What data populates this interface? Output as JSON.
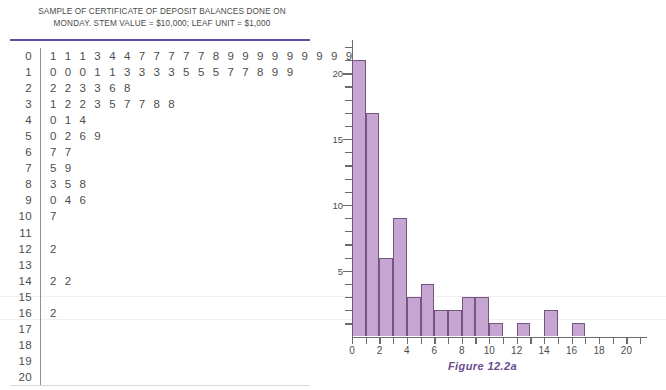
{
  "stem_leaf": {
    "title_line1": "SAMPLE OF CERTIFICATE OF DEPOSIT BALANCES DONE ON",
    "title_line2": "MONDAY. STEM VALUE  =  $10,000; LEAF UNIT  =  $1,000",
    "rows": [
      {
        "stem": "0",
        "leaves": "1 1 1 3 4 4 7 7 7 7 7 8 9 9 9 9 9 9 9 9 9"
      },
      {
        "stem": "1",
        "leaves": "0 0 0 1 1 3 3 3 3 5 5 5 7 7 8 9 9"
      },
      {
        "stem": "2",
        "leaves": "2 2 3 3 6 8"
      },
      {
        "stem": "3",
        "leaves": "1 2 2 3 5 7 7 8 8"
      },
      {
        "stem": "4",
        "leaves": "0 1 4"
      },
      {
        "stem": "5",
        "leaves": "0 2 6 9"
      },
      {
        "stem": "6",
        "leaves": "7 7"
      },
      {
        "stem": "7",
        "leaves": "5 9"
      },
      {
        "stem": "8",
        "leaves": "3 5 8"
      },
      {
        "stem": "9",
        "leaves": "0 4 6"
      },
      {
        "stem": "10",
        "leaves": "7"
      },
      {
        "stem": "11",
        "leaves": ""
      },
      {
        "stem": "12",
        "leaves": "2"
      },
      {
        "stem": "13",
        "leaves": ""
      },
      {
        "stem": "14",
        "leaves": "2 2"
      },
      {
        "stem": "15",
        "leaves": ""
      },
      {
        "stem": "16",
        "leaves": "2"
      },
      {
        "stem": "17",
        "leaves": ""
      },
      {
        "stem": "18",
        "leaves": ""
      },
      {
        "stem": "19",
        "leaves": ""
      },
      {
        "stem": "20",
        "leaves": ""
      }
    ]
  },
  "figure": {
    "caption": "Figure 12.2a",
    "caption_color": "#6b4a8f"
  },
  "chart_data": {
    "type": "bar",
    "title": "",
    "xlabel": "",
    "ylabel": "",
    "xlim": [
      0,
      21.5
    ],
    "ylim": [
      0,
      22
    ],
    "grid": false,
    "legend": null,
    "bin_width": 1,
    "bar_color": "#c6a5d3",
    "bar_edge_color": "#75567f",
    "x_ticks": [
      0,
      2,
      4,
      6,
      8,
      10,
      12,
      14,
      16,
      18,
      20
    ],
    "x_tick_labels": [
      "0",
      "2",
      "4",
      "6",
      "8",
      "10",
      "12",
      "14",
      "16",
      "18",
      "20"
    ],
    "x_minor_ticks": [
      1,
      3,
      5,
      7,
      9,
      11,
      13,
      15,
      17,
      19,
      21
    ],
    "y_ticks": [
      5,
      10,
      15,
      20
    ],
    "y_tick_labels": [
      "5",
      "10",
      "15",
      "20"
    ],
    "y_minor_step": 1,
    "bin_starts": [
      0,
      1,
      2,
      3,
      4,
      5,
      6,
      7,
      8,
      9,
      10,
      11,
      12,
      13,
      14,
      15,
      16
    ],
    "values": [
      21,
      17,
      6,
      9,
      3,
      4,
      2,
      2,
      3,
      3,
      1,
      0,
      1,
      0,
      2,
      0,
      1
    ]
  }
}
